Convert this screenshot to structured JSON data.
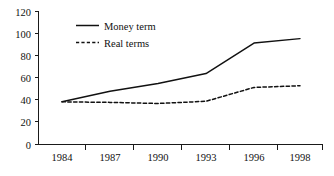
{
  "chart_data": {
    "type": "line",
    "title": "",
    "subtitle": "",
    "xlabel": "",
    "ylabel": "",
    "categories": [
      "1984",
      "1987",
      "1990",
      "1993",
      "1996",
      "1998"
    ],
    "x": [
      1984,
      1987,
      1990,
      1993,
      1996,
      1998
    ],
    "series": [
      {
        "name": "Money term",
        "style": "solid",
        "color": "#111111",
        "values": [
          38.5,
          48,
          55,
          64,
          91.5,
          95.5
        ]
      },
      {
        "name": "Real terms",
        "style": "dashed",
        "color": "#111111",
        "values": [
          38.5,
          38,
          37,
          39,
          51.5,
          53
        ]
      }
    ],
    "ylim": [
      0,
      120
    ],
    "yticks": [
      0,
      20,
      40,
      60,
      80,
      100,
      120
    ],
    "ytick_labels": [
      "0",
      "20",
      "40",
      "60",
      "80",
      "100",
      "120"
    ],
    "xtick_labels": [
      "1984",
      "1987",
      "1990",
      "1993",
      "1996",
      "1998"
    ],
    "grid": false,
    "legend_position": "upper-left-inside",
    "legend_entries": [
      "Money term",
      "Real terms"
    ],
    "background_color": "#ffffff",
    "axis_color": "#1a1a1a"
  },
  "axis": {
    "y_labels": [
      "120",
      "100",
      "80",
      "60",
      "40",
      "20",
      "0"
    ],
    "x_labels": [
      "1984",
      "1987",
      "1990",
      "1993",
      "1996",
      "1998"
    ]
  },
  "legend": {
    "items": [
      {
        "label": "Money term",
        "style": "solid"
      },
      {
        "label": "Real terms",
        "style": "dashed"
      }
    ]
  }
}
